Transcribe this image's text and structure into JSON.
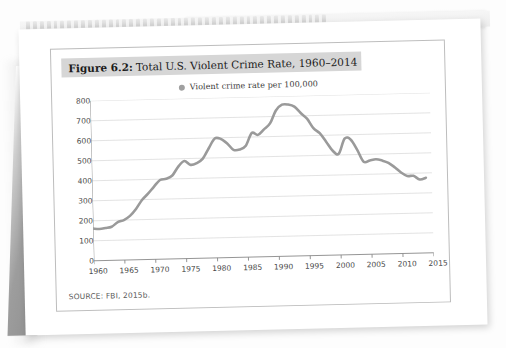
{
  "figure": {
    "label": "Figure 6.2:",
    "title": "Total U.S. Violent Crime Rate, 1960–2014",
    "source": "SOURCE: FBI, 2015b."
  },
  "legend": {
    "marker_color": "#a0a0a0",
    "label": "Violent crime rate per 100,000"
  },
  "chart_data": {
    "type": "line",
    "title": "Total U.S. Violent Crime Rate, 1960–2014",
    "xlabel": "",
    "ylabel": "",
    "xlim": [
      1960,
      2015
    ],
    "ylim": [
      0,
      800
    ],
    "grid": true,
    "legend_position": "top-center",
    "line_color": "#9a9a9a",
    "series_name": "Violent crime rate per 100,000",
    "yticks": [
      0,
      100,
      200,
      300,
      400,
      500,
      600,
      700,
      800
    ],
    "xticks": [
      1960,
      1965,
      1970,
      1975,
      1980,
      1985,
      1990,
      1995,
      2000,
      2005,
      2010,
      2015
    ],
    "x": [
      1960,
      1961,
      1962,
      1963,
      1964,
      1965,
      1966,
      1967,
      1968,
      1969,
      1970,
      1971,
      1972,
      1973,
      1974,
      1975,
      1976,
      1977,
      1978,
      1979,
      1980,
      1981,
      1982,
      1983,
      1984,
      1985,
      1986,
      1987,
      1988,
      1989,
      1990,
      1991,
      1992,
      1993,
      1994,
      1995,
      1996,
      1997,
      1998,
      1999,
      2000,
      2001,
      2002,
      2003,
      2004,
      2005,
      2006,
      2007,
      2008,
      2009,
      2010,
      2011,
      2012,
      2013,
      2014
    ],
    "values": [
      161,
      158,
      162,
      168,
      190,
      200,
      220,
      254,
      298,
      329,
      364,
      396,
      401,
      417,
      461,
      488,
      468,
      476,
      498,
      549,
      597,
      594,
      571,
      538,
      539,
      557,
      620,
      610,
      637,
      666,
      730,
      758,
      758,
      747,
      714,
      685,
      637,
      611,
      568,
      523,
      506,
      581,
      575,
      523,
      463,
      469,
      474,
      467,
      455,
      432,
      405,
      387,
      387,
      368,
      376
    ]
  }
}
